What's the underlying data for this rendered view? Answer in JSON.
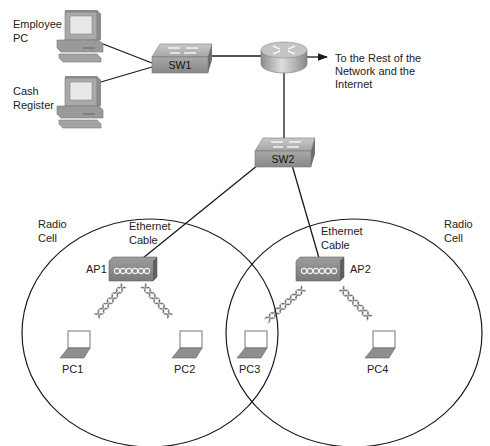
{
  "diagram": {
    "labels": {
      "employee_pc": [
        "Employee",
        "PC"
      ],
      "cash_register": [
        "Cash",
        "Register"
      ],
      "sw1": "SW1",
      "sw2": "SW2",
      "internet": [
        "To the Rest of the",
        "Network and the",
        "Internet"
      ],
      "radio_cell_left": [
        "Radio",
        "Cell"
      ],
      "radio_cell_right": [
        "Radio",
        "Cell"
      ],
      "ethernet_cable_left": [
        "Ethernet",
        "Cable"
      ],
      "ethernet_cable_right": [
        "Ethernet",
        "Cable"
      ],
      "ap1": "AP1",
      "ap2": "AP2",
      "pc1": "PC1",
      "pc2": "PC2",
      "pc3": "PC3",
      "pc4": "PC4"
    },
    "nodes": [
      {
        "id": "employee_pc",
        "type": "desktop"
      },
      {
        "id": "cash_register",
        "type": "desktop"
      },
      {
        "id": "sw1",
        "type": "switch"
      },
      {
        "id": "router",
        "type": "router"
      },
      {
        "id": "sw2",
        "type": "switch"
      },
      {
        "id": "ap1",
        "type": "access-point"
      },
      {
        "id": "ap2",
        "type": "access-point"
      },
      {
        "id": "pc1",
        "type": "laptop"
      },
      {
        "id": "pc2",
        "type": "laptop"
      },
      {
        "id": "pc3",
        "type": "laptop"
      },
      {
        "id": "pc4",
        "type": "laptop"
      }
    ],
    "links": [
      {
        "from": "employee_pc",
        "to": "sw1",
        "medium": "ethernet"
      },
      {
        "from": "cash_register",
        "to": "sw1",
        "medium": "ethernet"
      },
      {
        "from": "sw1",
        "to": "router",
        "medium": "ethernet"
      },
      {
        "from": "router",
        "to": "internet",
        "medium": "ethernet"
      },
      {
        "from": "router",
        "to": "sw2",
        "medium": "ethernet"
      },
      {
        "from": "sw2",
        "to": "ap1",
        "medium": "ethernet"
      },
      {
        "from": "sw2",
        "to": "ap2",
        "medium": "ethernet"
      },
      {
        "from": "ap1",
        "to": "pc1",
        "medium": "wireless"
      },
      {
        "from": "ap1",
        "to": "pc2",
        "medium": "wireless"
      },
      {
        "from": "ap2",
        "to": "pc3",
        "medium": "wireless"
      },
      {
        "from": "ap2",
        "to": "pc4",
        "medium": "wireless"
      }
    ],
    "colors": {
      "line": "#1a1a1a",
      "device_gray": "#9a9a9a",
      "device_dark": "#6e6e6e",
      "screen": "#e8e8e8"
    }
  }
}
